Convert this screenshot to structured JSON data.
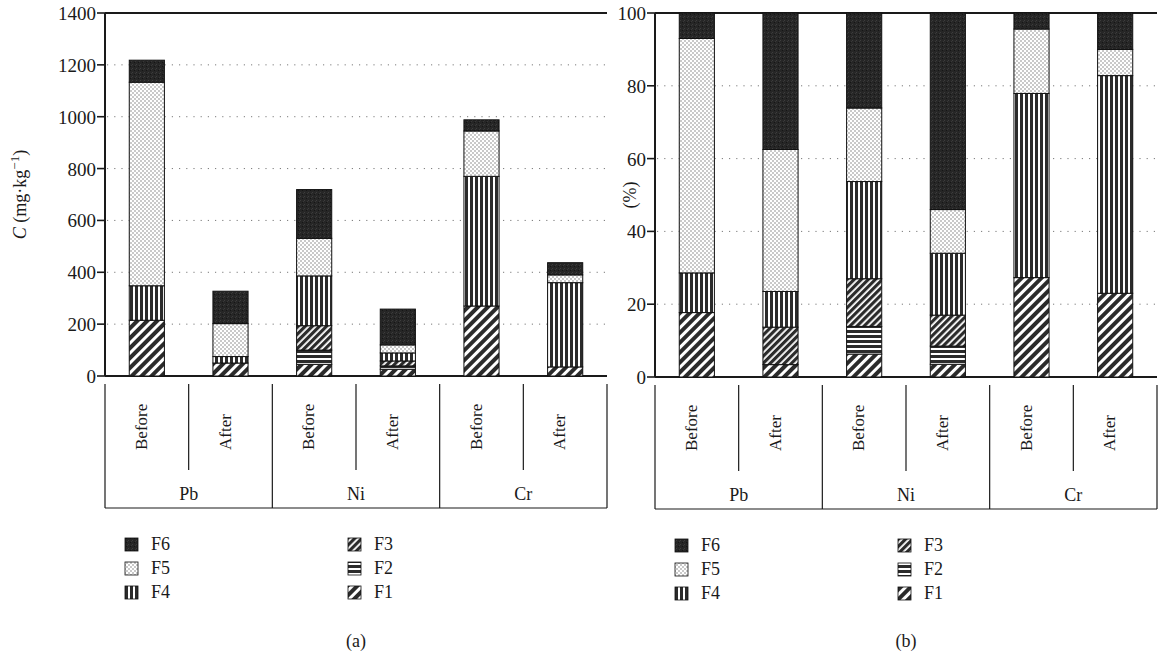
{
  "figure": {
    "panels": [
      {
        "key": "a",
        "caption": "(a)"
      },
      {
        "key": "b",
        "caption": "(b)"
      }
    ]
  },
  "legend": {
    "entries": [
      {
        "key": "F6",
        "label": "F6",
        "pattern": "solid-dark",
        "color": "#262626"
      },
      {
        "key": "F5",
        "label": "F5",
        "pattern": "light-checker",
        "color": "#d9d9d9"
      },
      {
        "key": "F4",
        "label": "F4",
        "pattern": "vertical-lines",
        "color": "#333333"
      },
      {
        "key": "F3",
        "label": "F3",
        "pattern": "dense-diagonal",
        "color": "#2e2e2e"
      },
      {
        "key": "F2",
        "label": "F2",
        "pattern": "horizontal-lines",
        "color": "#333333"
      },
      {
        "key": "F1",
        "label": "F1",
        "pattern": "sparse-diagonal",
        "color": "#303030"
      }
    ],
    "columns": [
      [
        "F6",
        "F5",
        "F4"
      ],
      [
        "F3",
        "F2",
        "F1"
      ]
    ]
  },
  "chart_data": [
    {
      "panel": "a",
      "type": "bar",
      "stacked": true,
      "title": "",
      "xlabel": "",
      "ylabel": "C (mg·kg⁻¹)",
      "ylabel_parts": {
        "italic": "C",
        "rest": " (mg·kg",
        "sup": "−1",
        "close": ")"
      },
      "ylim": [
        0,
        1400
      ],
      "yticks": [
        0,
        200,
        400,
        600,
        800,
        1000,
        1200,
        1400
      ],
      "ytick_labels": [
        "0",
        "200",
        "400",
        "600",
        "800",
        "1000",
        "1200",
        "1400"
      ],
      "grid": true,
      "grid_axis": "y",
      "legend_position": "below",
      "groups": [
        "Pb",
        "Ni",
        "Cr"
      ],
      "categories": [
        "Before",
        "After"
      ],
      "series_order": [
        "F1",
        "F2",
        "F3",
        "F4",
        "F5",
        "F6"
      ],
      "bars": [
        {
          "group": "Pb",
          "category": "Before",
          "total": 1218,
          "segments": [
            {
              "key": "F1",
              "value": 215
            },
            {
              "key": "F2",
              "value": 0
            },
            {
              "key": "F3",
              "value": 0
            },
            {
              "key": "F4",
              "value": 133
            },
            {
              "key": "F5",
              "value": 785
            },
            {
              "key": "F6",
              "value": 85
            }
          ]
        },
        {
          "group": "Pb",
          "category": "After",
          "total": 327,
          "segments": [
            {
              "key": "F1",
              "value": 50
            },
            {
              "key": "F2",
              "value": 0
            },
            {
              "key": "F3",
              "value": 0
            },
            {
              "key": "F4",
              "value": 25
            },
            {
              "key": "F5",
              "value": 127
            },
            {
              "key": "F6",
              "value": 125
            }
          ]
        },
        {
          "group": "Ni",
          "category": "Before",
          "total": 719,
          "segments": [
            {
              "key": "F1",
              "value": 45
            },
            {
              "key": "F2",
              "value": 55
            },
            {
              "key": "F3",
              "value": 94
            },
            {
              "key": "F4",
              "value": 192
            },
            {
              "key": "F5",
              "value": 145
            },
            {
              "key": "F6",
              "value": 188
            }
          ]
        },
        {
          "group": "Ni",
          "category": "After",
          "total": 258,
          "segments": [
            {
              "key": "F1",
              "value": 26
            },
            {
              "key": "F2",
              "value": 13
            },
            {
              "key": "F3",
              "value": 19
            },
            {
              "key": "F4",
              "value": 31
            },
            {
              "key": "F5",
              "value": 31
            },
            {
              "key": "F6",
              "value": 138
            }
          ]
        },
        {
          "group": "Cr",
          "category": "Before",
          "total": 988,
          "segments": [
            {
              "key": "F1",
              "value": 270
            },
            {
              "key": "F2",
              "value": 0
            },
            {
              "key": "F3",
              "value": 0
            },
            {
              "key": "F4",
              "value": 500
            },
            {
              "key": "F5",
              "value": 175
            },
            {
              "key": "F6",
              "value": 43
            }
          ]
        },
        {
          "group": "Cr",
          "category": "After",
          "total": 437,
          "segments": [
            {
              "key": "F1",
              "value": 35
            },
            {
              "key": "F2",
              "value": 0
            },
            {
              "key": "F3",
              "value": 0
            },
            {
              "key": "F4",
              "value": 325
            },
            {
              "key": "F5",
              "value": 30
            },
            {
              "key": "F6",
              "value": 47
            }
          ]
        }
      ]
    },
    {
      "panel": "b",
      "type": "bar",
      "stacked": true,
      "title": "",
      "xlabel": "",
      "ylabel": "(%)",
      "ylim": [
        0,
        100
      ],
      "yticks": [
        0,
        20,
        40,
        60,
        80,
        100
      ],
      "ytick_labels": [
        "0",
        "20",
        "40",
        "60",
        "80",
        "100"
      ],
      "grid": true,
      "grid_axis": "y",
      "legend_position": "below",
      "groups": [
        "Pb",
        "Ni",
        "Cr"
      ],
      "categories": [
        "Before",
        "After"
      ],
      "series_order": [
        "F1",
        "F2",
        "F3",
        "F4",
        "F5",
        "F6"
      ],
      "bars": [
        {
          "group": "Pb",
          "category": "Before",
          "total": 100,
          "segments": [
            {
              "key": "F1",
              "value": 17.7
            },
            {
              "key": "F2",
              "value": 0
            },
            {
              "key": "F3",
              "value": 0
            },
            {
              "key": "F4",
              "value": 10.9
            },
            {
              "key": "F5",
              "value": 64.4
            },
            {
              "key": "F6",
              "value": 7.0
            }
          ]
        },
        {
          "group": "Pb",
          "category": "After",
          "total": 100,
          "segments": [
            {
              "key": "F1",
              "value": 3.4
            },
            {
              "key": "F2",
              "value": 0
            },
            {
              "key": "F3",
              "value": 10.3
            },
            {
              "key": "F4",
              "value": 9.8
            },
            {
              "key": "F5",
              "value": 39.0
            },
            {
              "key": "F6",
              "value": 37.5
            }
          ]
        },
        {
          "group": "Ni",
          "category": "Before",
          "total": 100,
          "segments": [
            {
              "key": "F1",
              "value": 6.3
            },
            {
              "key": "F2",
              "value": 7.6
            },
            {
              "key": "F3",
              "value": 13.1
            },
            {
              "key": "F4",
              "value": 26.7
            },
            {
              "key": "F5",
              "value": 20.2
            },
            {
              "key": "F6",
              "value": 26.1
            }
          ]
        },
        {
          "group": "Ni",
          "category": "After",
          "total": 100,
          "segments": [
            {
              "key": "F1",
              "value": 3.5
            },
            {
              "key": "F2",
              "value": 5.0
            },
            {
              "key": "F3",
              "value": 8.5
            },
            {
              "key": "F4",
              "value": 17.0
            },
            {
              "key": "F5",
              "value": 12.0
            },
            {
              "key": "F6",
              "value": 54.0
            }
          ]
        },
        {
          "group": "Cr",
          "category": "Before",
          "total": 100,
          "segments": [
            {
              "key": "F1",
              "value": 27.3
            },
            {
              "key": "F2",
              "value": 0
            },
            {
              "key": "F3",
              "value": 0
            },
            {
              "key": "F4",
              "value": 50.6
            },
            {
              "key": "F5",
              "value": 17.7
            },
            {
              "key": "F6",
              "value": 4.4
            }
          ]
        },
        {
          "group": "Cr",
          "category": "After",
          "total": 100,
          "segments": [
            {
              "key": "F1",
              "value": 23.0
            },
            {
              "key": "F2",
              "value": 0
            },
            {
              "key": "F3",
              "value": 0
            },
            {
              "key": "F4",
              "value": 59.8
            },
            {
              "key": "F5",
              "value": 7.2
            },
            {
              "key": "F6",
              "value": 10.0
            }
          ]
        }
      ]
    }
  ]
}
